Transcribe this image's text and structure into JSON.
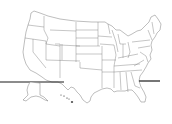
{
  "map": {
    "title": "United States outline map",
    "region": "United States",
    "style": "state boundaries, black outline on white",
    "insets": [
      "Alaska",
      "Hawaii"
    ],
    "colors": {
      "background": "#ffffff",
      "state_stroke": "#6e6e6e",
      "rule_line": "#1a1a1a"
    }
  }
}
